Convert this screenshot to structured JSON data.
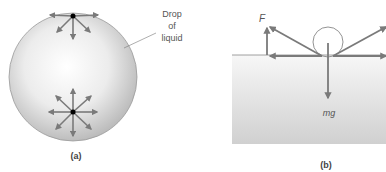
{
  "panel_a": {
    "caption": "(a)",
    "label_line1": "Drop",
    "label_line2": "of",
    "label_line3": "liquid"
  },
  "panel_b": {
    "caption": "(b)",
    "force_label": "F",
    "weight_label": "mg"
  },
  "colors": {
    "arrow": "#7a7a7a",
    "drop_fill": "#e2e2e2",
    "liquid_fill": "#dcdcdc",
    "point": "#000000"
  }
}
